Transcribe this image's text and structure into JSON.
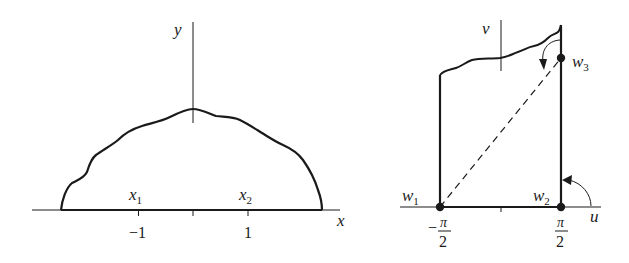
{
  "left_plane": {
    "x_axis_label": "x",
    "y_axis_label": "y",
    "point_labels": [
      {
        "name": "x",
        "sub": "1"
      },
      {
        "name": "x",
        "sub": "2"
      }
    ],
    "tick_labels": [
      "−1",
      "1"
    ]
  },
  "right_plane": {
    "u_axis_label": "u",
    "v_axis_label": "v",
    "points": [
      {
        "name": "w",
        "sub": "1"
      },
      {
        "name": "w",
        "sub": "2"
      },
      {
        "name": "w",
        "sub": "3"
      }
    ],
    "tick_labels": {
      "left": {
        "sign": "−",
        "num": "π",
        "den": "2"
      },
      "right": {
        "num": "π",
        "den": "2"
      }
    }
  },
  "colors": {
    "ink": "#1a1a1a",
    "background": "#ffffff"
  }
}
